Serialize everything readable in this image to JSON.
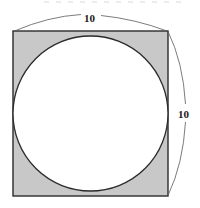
{
  "figure": {
    "type": "geometry-diagram",
    "canvas": {
      "width": 200,
      "height": 208,
      "background": "#ffffff"
    },
    "square": {
      "name": "outer-square",
      "x": 13,
      "y": 31,
      "width": 155,
      "height": 165,
      "fill_color": "#c8c8c8",
      "stroke_color": "#2b2b2b",
      "stroke_width": 1.4,
      "side_length_value": "10"
    },
    "circle": {
      "name": "inscribed-circle",
      "cx": 90.5,
      "cy": 113.5,
      "r": 77.5,
      "fill_color": "#ffffff",
      "stroke_color": "#2b2b2b",
      "stroke_width": 1.3,
      "relationship": "inscribed, tangent to all four sides"
    },
    "dimensions": [
      {
        "name": "top-dimension",
        "label": "10",
        "orientation": "horizontal",
        "position": "top",
        "arc_bulge": "outward-up",
        "stroke_color": "#5a5a5a",
        "stroke_width": 0.8
      },
      {
        "name": "right-dimension",
        "label": "10",
        "orientation": "vertical",
        "position": "right",
        "arc_bulge": "outward-right",
        "stroke_color": "#5a5a5a",
        "stroke_width": 0.8
      }
    ],
    "shaded_region": {
      "name": "corner-shaded-region",
      "description": "square area outside the circle",
      "fill_color": "#c8c8c8"
    }
  }
}
